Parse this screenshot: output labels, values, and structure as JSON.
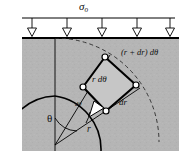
{
  "figure": {
    "title_label": "σ",
    "title_subscript": "o",
    "type": "engineering-diagram",
    "colors": {
      "hatch_fill": "#b4b4b4",
      "element_fill": "#c9c9c9",
      "line": "#000000",
      "background": "#ffffff",
      "arrow_fill": "#ffffff"
    },
    "surface": {
      "load_arrow_count": 5,
      "load_line_y": 18,
      "surface_y": 38
    },
    "labels": {
      "applied_stress": "σ",
      "applied_stress_sub": "o",
      "outer_arc_length": "(r + dr) dθ",
      "inner_arc_length": "r dθ",
      "radial_thickness": "dr",
      "angle_increment": "dθ",
      "polar_angle": "θ",
      "radius": "r"
    },
    "geometry": {
      "nodes": [
        {
          "name": "outer-top",
          "x": 105,
          "y": 57
        },
        {
          "name": "outer-right",
          "x": 136,
          "y": 85
        },
        {
          "name": "inner-left",
          "x": 83,
          "y": 87
        },
        {
          "name": "inner-bottom",
          "x": 106,
          "y": 111
        }
      ],
      "origin": {
        "x": 55,
        "y": 145
      },
      "hole_radius": 48,
      "dashed_arc_radius": 100
    }
  }
}
